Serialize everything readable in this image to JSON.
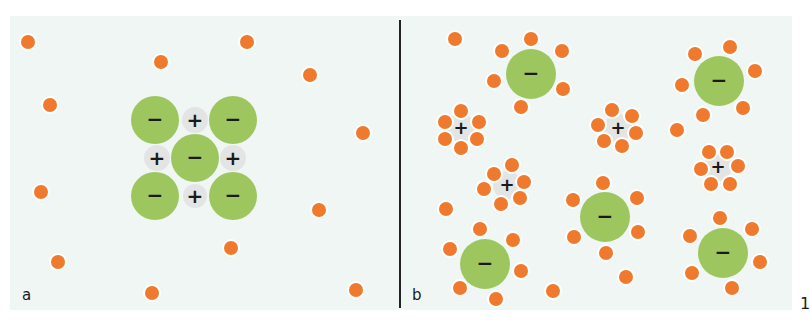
{
  "figure": {
    "figure_number": "1",
    "colors": {
      "background": "#eff6f4",
      "orange_particle": "#ef7a2e",
      "green_anion": "#9dc75e",
      "cation_halo": "#e2e5e3",
      "divider": "#222222"
    },
    "panels": [
      {
        "label": "a",
        "description": "Ionic crystal lattice with free solvent molecules",
        "free_orange_dots": [
          [
            28,
            42
          ],
          [
            247,
            42
          ],
          [
            161,
            62
          ],
          [
            310,
            75
          ],
          [
            50,
            105
          ],
          [
            363,
            133
          ],
          [
            41,
            192
          ],
          [
            319,
            210
          ],
          [
            231,
            248
          ],
          [
            58,
            262
          ],
          [
            152,
            293
          ],
          [
            356,
            290
          ]
        ],
        "anions": [
          {
            "x": 155,
            "y": 120,
            "r": 24,
            "symbol": "−"
          },
          {
            "x": 233,
            "y": 120,
            "r": 24,
            "symbol": "−"
          },
          {
            "x": 195,
            "y": 158,
            "r": 24,
            "symbol": "−"
          },
          {
            "x": 155,
            "y": 196,
            "r": 24,
            "symbol": "−"
          },
          {
            "x": 233,
            "y": 196,
            "r": 24,
            "symbol": "−"
          }
        ],
        "cations": [
          {
            "x": 195,
            "y": 120,
            "r": 13,
            "symbol": "+"
          },
          {
            "x": 157,
            "y": 158,
            "r": 13,
            "symbol": "+"
          },
          {
            "x": 233,
            "y": 158,
            "r": 13,
            "symbol": "+"
          },
          {
            "x": 195,
            "y": 196,
            "r": 12,
            "symbol": "+"
          }
        ]
      },
      {
        "label": "b",
        "description": "Dissolved ions surrounded by solvent molecules",
        "free_orange_dots": [
          [
            455,
            39
          ],
          [
            677,
            130
          ],
          [
            446,
            209
          ],
          [
            553,
            291
          ],
          [
            626,
            277
          ]
        ],
        "anions": [
          {
            "x": 531,
            "y": 74,
            "r": 25,
            "symbol": "−",
            "shell": [
              [
                531,
                39
              ],
              [
                502,
                51
              ],
              [
                562,
                51
              ],
              [
                494,
                81
              ],
              [
                563,
                89
              ],
              [
                521,
                107
              ]
            ]
          },
          {
            "x": 719,
            "y": 81,
            "r": 25,
            "symbol": "−",
            "shell": [
              [
                730,
                47
              ],
              [
                695,
                54
              ],
              [
                755,
                71
              ],
              [
                682,
                85
              ],
              [
                743,
                108
              ],
              [
                703,
                115
              ]
            ]
          },
          {
            "x": 605,
            "y": 217,
            "r": 25,
            "symbol": "−",
            "shell": [
              [
                603,
                183
              ],
              [
                573,
                200
              ],
              [
                637,
                198
              ],
              [
                574,
                237
              ],
              [
                638,
                232
              ],
              [
                606,
                253
              ]
            ]
          },
          {
            "x": 485,
            "y": 264,
            "r": 25,
            "symbol": "−",
            "shell": [
              [
                480,
                229
              ],
              [
                513,
                240
              ],
              [
                450,
                249
              ],
              [
                521,
                271
              ],
              [
                460,
                288
              ],
              [
                496,
                299
              ]
            ]
          },
          {
            "x": 723,
            "y": 253,
            "r": 25,
            "symbol": "−",
            "shell": [
              [
                720,
                218
              ],
              [
                752,
                229
              ],
              [
                690,
                236
              ],
              [
                760,
                262
              ],
              [
                692,
                273
              ],
              [
                732,
                288
              ]
            ]
          }
        ],
        "cations": [
          {
            "x": 461,
            "y": 128,
            "r": 10,
            "symbol": "+",
            "shell": [
              [
                461,
                111
              ],
              [
                445,
                122
              ],
              [
                479,
                122
              ],
              [
                445,
                139
              ],
              [
                477,
                139
              ],
              [
                461,
                148
              ]
            ]
          },
          {
            "x": 618,
            "y": 128,
            "r": 10,
            "symbol": "+",
            "shell": [
              [
                612,
                110
              ],
              [
                632,
                116
              ],
              [
                598,
                125
              ],
              [
                636,
                133
              ],
              [
                604,
                141
              ],
              [
                622,
                146
              ]
            ]
          },
          {
            "x": 718,
            "y": 167,
            "r": 10,
            "symbol": "+",
            "shell": [
              [
                709,
                152
              ],
              [
                727,
                152
              ],
              [
                701,
                169
              ],
              [
                738,
                166
              ],
              [
                711,
                184
              ],
              [
                730,
                184
              ]
            ]
          },
          {
            "x": 507,
            "y": 185,
            "r": 10,
            "symbol": "+",
            "shell": [
              [
                494,
                174
              ],
              [
                512,
                165
              ],
              [
                524,
                182
              ],
              [
                484,
                189
              ],
              [
                520,
                198
              ],
              [
                501,
                204
              ]
            ]
          }
        ]
      }
    ]
  }
}
